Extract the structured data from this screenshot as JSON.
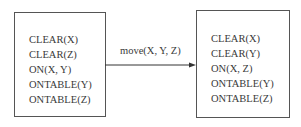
{
  "diagram": {
    "initial_state": {
      "predicates": [
        "CLEAR(X)",
        "CLEAR(Z)",
        "ON(X, Y)",
        "ONTABLE(Y)",
        "ONTABLE(Z)"
      ]
    },
    "action": {
      "label": "move(X, Y, Z)"
    },
    "result_state": {
      "predicates": [
        "CLEAR(X)",
        "CLEAR(Y)",
        "ON(X, Z)",
        "ONTABLE(Y)",
        "ONTABLE(Z)"
      ]
    }
  }
}
